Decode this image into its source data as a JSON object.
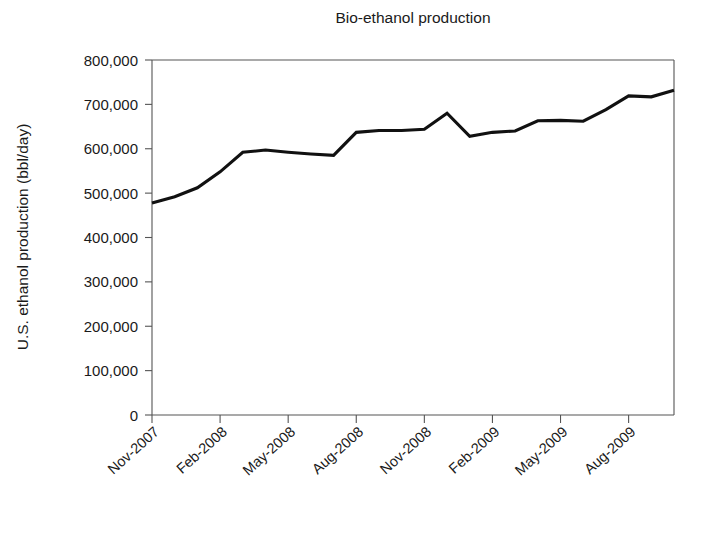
{
  "chart_data": {
    "type": "line",
    "title": "Bio-ethanol production",
    "xlabel": "",
    "ylabel": "U.S. ethanol production (bbl/day)",
    "ylim": [
      0,
      800000
    ],
    "yticks": [
      0,
      100000,
      200000,
      300000,
      400000,
      500000,
      600000,
      700000,
      800000
    ],
    "ytick_labels": [
      "0",
      "100,000",
      "200,000",
      "300,000",
      "400,000",
      "500,000",
      "600,000",
      "700,000",
      "800,000"
    ],
    "xtick_labels": [
      "Nov-2007",
      "Feb-2008",
      "May-2008",
      "Aug-2008",
      "Nov-2008",
      "Feb-2009",
      "May-2009",
      "Aug-2009"
    ],
    "xtick_indices": [
      0,
      3,
      6,
      9,
      12,
      15,
      18,
      21
    ],
    "grid": false,
    "legend": false,
    "series": [
      {
        "name": "U.S. ethanol production",
        "color": "#111111",
        "x": [
          "Nov-2007",
          "Dec-2007",
          "Jan-2008",
          "Feb-2008",
          "Mar-2008",
          "Apr-2008",
          "May-2008",
          "Jun-2008",
          "Jul-2008",
          "Aug-2008",
          "Sep-2008",
          "Oct-2008",
          "Nov-2008",
          "Dec-2008",
          "Jan-2009",
          "Feb-2009",
          "Mar-2009",
          "Apr-2009",
          "May-2009",
          "Jun-2009",
          "Jul-2009",
          "Aug-2009",
          "Sep-2009",
          "Oct-2009"
        ],
        "values": [
          478000,
          492000,
          512000,
          548000,
          592000,
          597000,
          592000,
          588000,
          585000,
          637000,
          641000,
          641000,
          644000,
          680000,
          628000,
          637000,
          640000,
          663000,
          664000,
          662000,
          688000,
          719000,
          717000,
          732000
        ]
      }
    ]
  },
  "figure": {
    "plot_left_px": 152,
    "plot_right_px": 674,
    "plot_top_px": 60,
    "plot_bottom_px": 415
  }
}
